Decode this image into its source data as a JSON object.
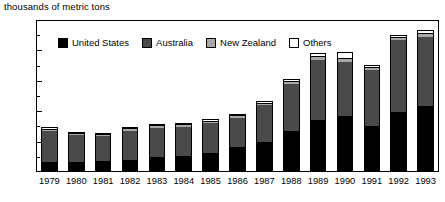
{
  "chart_data": {
    "type": "bar",
    "subtype": "stacked-vertical",
    "title": "",
    "axis_caption": "thousands of metric tons",
    "xlabel": "",
    "ylabel": "",
    "ylim": [
      0,
      500
    ],
    "ytick_labels": [
      "0",
      "100",
      "200",
      "300",
      "400",
      "500"
    ],
    "ytick_values": [
      0,
      100,
      200,
      300,
      400,
      500
    ],
    "yminor_values": [
      50,
      150,
      250,
      350,
      450
    ],
    "grid": false,
    "legend_position": "inside-top-left",
    "categories": [
      "1979",
      "1980",
      "1981",
      "1982",
      "1983",
      "1984",
      "1985",
      "1986",
      "1987",
      "1988",
      "1989",
      "1990",
      "1991",
      "1992",
      "1993"
    ],
    "series": [
      {
        "name": "United States",
        "color": "#000000",
        "values": [
          32,
          33,
          36,
          41,
          48,
          52,
          62,
          82,
          100,
          134,
          172,
          183,
          150,
          196,
          218
        ]
      },
      {
        "name": "Australia",
        "color": "#4a4a4a",
        "values": [
          102,
          89,
          83,
          95,
          97,
          95,
          99,
          96,
          120,
          156,
          198,
          180,
          186,
          238,
          225
        ]
      },
      {
        "name": "New Zealand",
        "color": "#a8a8a8",
        "values": [
          8,
          5,
          4,
          8,
          9,
          10,
          8,
          8,
          8,
          10,
          12,
          12,
          10,
          10,
          14
        ]
      },
      {
        "name": "Others",
        "color": "#ffffff",
        "values": [
          2,
          2,
          2,
          2,
          2,
          2,
          3,
          4,
          4,
          4,
          8,
          20,
          6,
          8,
          10
        ]
      }
    ],
    "totals": [
      144,
      129,
      125,
      146,
      156,
      159,
      172,
      190,
      232,
      304,
      390,
      395,
      352,
      452,
      467
    ]
  },
  "legend": {
    "items": [
      {
        "label": "United States",
        "swatch": "legend-swatch-black"
      },
      {
        "label": "Australia",
        "swatch": "legend-swatch-dark-gray"
      },
      {
        "label": "New Zealand",
        "swatch": "legend-swatch-light-gray"
      },
      {
        "label": "Others",
        "swatch": "legend-swatch-white"
      }
    ]
  }
}
